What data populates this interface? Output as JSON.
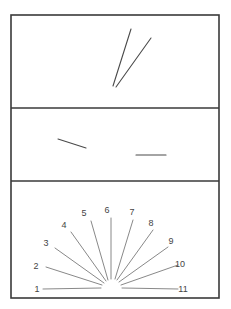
{
  "figure": {
    "panels": [
      {
        "id": "top",
        "segments": [
          {
            "x1": 113,
            "y1": 86,
            "x2": 131,
            "y2": 29
          },
          {
            "x1": 116,
            "y1": 87,
            "x2": 151,
            "y2": 38
          }
        ]
      },
      {
        "id": "middle",
        "segments": [
          {
            "x1": 58,
            "y1": 139,
            "x2": 86,
            "y2": 148
          },
          {
            "x1": 136,
            "y1": 155,
            "x2": 166,
            "y2": 155
          }
        ]
      },
      {
        "id": "bottom",
        "reference_fan": {
          "rays": [
            {
              "label": "1",
              "x1": 43,
              "y1": 289,
              "x2": 101,
              "y2": 288,
              "lx": 37,
              "ly": 292
            },
            {
              "label": "2",
              "x1": 46,
              "y1": 267,
              "x2": 102,
              "y2": 285,
              "lx": 36,
              "ly": 269
            },
            {
              "label": "3",
              "x1": 55,
              "y1": 248,
              "x2": 104,
              "y2": 283,
              "lx": 46,
              "ly": 246
            },
            {
              "label": "4",
              "x1": 71,
              "y1": 232,
              "x2": 106,
              "y2": 281,
              "lx": 64,
              "ly": 228
            },
            {
              "label": "5",
              "x1": 91,
              "y1": 221,
              "x2": 108,
              "y2": 280,
              "lx": 84,
              "ly": 216
            },
            {
              "label": "6",
              "x1": 111,
              "y1": 218,
              "x2": 111,
              "y2": 279,
              "lx": 107,
              "ly": 213
            },
            {
              "label": "7",
              "x1": 133,
              "y1": 220,
              "x2": 115,
              "y2": 279,
              "lx": 132,
              "ly": 215
            },
            {
              "label": "8",
              "x1": 153,
              "y1": 230,
              "x2": 117,
              "y2": 280,
              "lx": 151,
              "ly": 226
            },
            {
              "label": "9",
              "x1": 168,
              "y1": 247,
              "x2": 119,
              "y2": 282,
              "lx": 171,
              "ly": 244
            },
            {
              "label": "10",
              "x1": 178,
              "y1": 265,
              "x2": 121,
              "y2": 285,
              "lx": 180,
              "ly": 267
            },
            {
              "label": "11",
              "x1": 178,
              "y1": 289,
              "x2": 122,
              "y2": 288,
              "lx": 183,
              "ly": 292
            }
          ]
        }
      }
    ],
    "frame": {
      "x": 11,
      "y": 15,
      "width": 208,
      "height": 283
    },
    "dividers_y": [
      108,
      181
    ]
  }
}
